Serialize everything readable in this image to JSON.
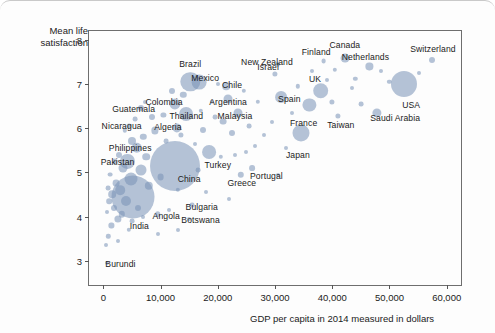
{
  "chart_data": {
    "type": "scatter",
    "title": "",
    "xlabel": "GDP per capita in 2014 measured in dollars",
    "ylabel": "Mean life\nsatisfaction",
    "xlim": [
      -2500,
      62500
    ],
    "ylim": [
      2.45,
      8.2
    ],
    "xticks": [
      0,
      10000,
      20000,
      30000,
      40000,
      50000,
      60000
    ],
    "xticklabels": [
      "0",
      "10,000",
      "20,000",
      "30,000",
      "40,000",
      "50,000",
      "60,000"
    ],
    "yticks": [
      3,
      4,
      5,
      6,
      7,
      8
    ],
    "yticklabels": [
      "3",
      "4",
      "5",
      "6",
      "7",
      "8"
    ],
    "grid": false,
    "legend": false,
    "bubble_color": "#7892b7",
    "frame_color": "#6e6e6e",
    "size_encoding": "population",
    "points": [
      {
        "name": "Switzerland",
        "x": 57500,
        "y": 7.55,
        "r": 3.0,
        "label_x": 57600,
        "label_y": 7.8
      },
      {
        "name": "USA",
        "x": 52500,
        "y": 7.0,
        "r": 13.0,
        "label_x": 53800,
        "label_y": 6.53
      },
      {
        "name": "Netherlands",
        "x": 46500,
        "y": 7.4,
        "r": 3.6,
        "label_x": 45800,
        "label_y": 7.62
      },
      {
        "name": "Canada",
        "x": 42300,
        "y": 7.58,
        "r": 4.4,
        "label_x": 42200,
        "label_y": 7.88
      },
      {
        "name": "Finland",
        "x": 38500,
        "y": 7.52,
        "r": 2.4,
        "label_x": 37200,
        "label_y": 7.72
      },
      {
        "name": "Saudi Arabia",
        "x": 47800,
        "y": 6.35,
        "r": 4.6,
        "label_x": 51000,
        "label_y": 6.22
      },
      {
        "name": "UK",
        "x": 38000,
        "y": 6.85,
        "r": 7.8,
        "label_x": 37000,
        "label_y": 7.12
      },
      {
        "name": "Taiwan",
        "x": 41000,
        "y": 6.27,
        "r": 2.6,
        "label_x": 41500,
        "label_y": 6.07
      },
      {
        "name": "France",
        "x": 36000,
        "y": 6.52,
        "r": 6.6,
        "label_x": 35000,
        "label_y": 6.12
      },
      {
        "name": "Spain",
        "x": 31000,
        "y": 6.7,
        "r": 5.9,
        "label_x": 32500,
        "label_y": 6.65
      },
      {
        "name": "Japan",
        "x": 34500,
        "y": 5.9,
        "r": 8.5,
        "label_x": 34000,
        "label_y": 5.4
      },
      {
        "name": "Israel",
        "x": 30000,
        "y": 7.22,
        "r": 2.6,
        "label_x": 28800,
        "label_y": 7.38
      },
      {
        "name": "New Zealand",
        "x": 30500,
        "y": 7.45,
        "r": 2.2,
        "label_x": 28600,
        "label_y": 7.5
      },
      {
        "name": "Portugal",
        "x": 26000,
        "y": 5.1,
        "r": 2.9,
        "label_x": 28500,
        "label_y": 4.92
      },
      {
        "name": "Greece",
        "x": 24000,
        "y": 4.95,
        "r": 3.2,
        "label_x": 24200,
        "label_y": 4.75
      },
      {
        "name": "Turkey",
        "x": 18500,
        "y": 5.45,
        "r": 6.9,
        "label_x": 20000,
        "label_y": 5.17
      },
      {
        "name": "Malaysia",
        "x": 23500,
        "y": 6.35,
        "r": 4.5,
        "label_x": 23000,
        "label_y": 6.28
      },
      {
        "name": "Argentina",
        "x": 21800,
        "y": 6.65,
        "r": 4.5,
        "label_x": 21800,
        "label_y": 6.6
      },
      {
        "name": "Chile",
        "x": 21500,
        "y": 6.95,
        "r": 3.8,
        "label_x": 22500,
        "label_y": 6.97
      },
      {
        "name": "Mexico",
        "x": 16800,
        "y": 7.05,
        "r": 7.4,
        "label_x": 17800,
        "label_y": 7.14
      },
      {
        "name": "Brazil",
        "x": 15200,
        "y": 7.05,
        "r": 9.7,
        "label_x": 15200,
        "label_y": 7.46
      },
      {
        "name": "Thailand",
        "x": 14500,
        "y": 6.32,
        "r": 6.9,
        "label_x": 14500,
        "label_y": 6.27
      },
      {
        "name": "Colombia",
        "x": 12500,
        "y": 6.55,
        "r": 5.6,
        "label_x": 10600,
        "label_y": 6.6
      },
      {
        "name": "Algeria",
        "x": 12800,
        "y": 6.0,
        "r": 4.6,
        "label_x": 11300,
        "label_y": 6.03
      },
      {
        "name": "China",
        "x": 12500,
        "y": 5.15,
        "r": 25.0,
        "label_x": 15000,
        "label_y": 4.85
      },
      {
        "name": "Bulgaria",
        "x": 15500,
        "y": 4.25,
        "r": 2.4,
        "label_x": 17200,
        "label_y": 4.22
      },
      {
        "name": "Botswana",
        "x": 15000,
        "y": 3.95,
        "r": 2.0,
        "label_x": 17000,
        "label_y": 3.92
      },
      {
        "name": "Angola",
        "x": 9500,
        "y": 4.05,
        "r": 2.8,
        "label_x": 11000,
        "label_y": 4.02
      },
      {
        "name": "Guatemala",
        "x": 6500,
        "y": 6.45,
        "r": 3.0,
        "label_x": 5300,
        "label_y": 6.43
      },
      {
        "name": "Nicaragua",
        "x": 4500,
        "y": 6.05,
        "r": 2.4,
        "label_x": 3200,
        "label_y": 6.05
      },
      {
        "name": "Philippines",
        "x": 5800,
        "y": 5.55,
        "r": 5.2,
        "label_x": 4700,
        "label_y": 5.55
      },
      {
        "name": "Pakistan",
        "x": 4200,
        "y": 5.25,
        "r": 7.1,
        "label_x": 2500,
        "label_y": 5.23
      },
      {
        "name": "India",
        "x": 5200,
        "y": 4.45,
        "r": 21.5,
        "label_x": 6300,
        "label_y": 3.78
      },
      {
        "name": "Burundi",
        "x": 700,
        "y": 2.95,
        "r": 2.0,
        "label_x": 3000,
        "label_y": 2.93
      }
    ],
    "unlabeled_points": [
      {
        "x": 55200,
        "y": 7.25,
        "r": 2.0
      },
      {
        "x": 50000,
        "y": 7.05,
        "r": 2.2
      },
      {
        "x": 48500,
        "y": 7.3,
        "r": 2.0
      },
      {
        "x": 45000,
        "y": 6.55,
        "r": 2.4
      },
      {
        "x": 44000,
        "y": 7.12,
        "r": 2.2
      },
      {
        "x": 43500,
        "y": 6.9,
        "r": 2.0
      },
      {
        "x": 40500,
        "y": 7.32,
        "r": 2.2
      },
      {
        "x": 40000,
        "y": 6.6,
        "r": 2.6
      },
      {
        "x": 39000,
        "y": 7.1,
        "r": 2.0
      },
      {
        "x": 36500,
        "y": 7.3,
        "r": 2.0
      },
      {
        "x": 34000,
        "y": 6.95,
        "r": 2.2
      },
      {
        "x": 33000,
        "y": 6.35,
        "r": 2.0
      },
      {
        "x": 32000,
        "y": 5.55,
        "r": 2.0
      },
      {
        "x": 29500,
        "y": 6.15,
        "r": 2.0
      },
      {
        "x": 28000,
        "y": 5.85,
        "r": 2.0
      },
      {
        "x": 27000,
        "y": 6.6,
        "r": 2.2
      },
      {
        "x": 26500,
        "y": 5.6,
        "r": 2.0
      },
      {
        "x": 25500,
        "y": 6.05,
        "r": 2.4
      },
      {
        "x": 25000,
        "y": 5.45,
        "r": 2.0
      },
      {
        "x": 24500,
        "y": 6.85,
        "r": 2.2
      },
      {
        "x": 23000,
        "y": 5.4,
        "r": 2.0
      },
      {
        "x": 22500,
        "y": 5.9,
        "r": 3.0
      },
      {
        "x": 21000,
        "y": 6.15,
        "r": 3.4
      },
      {
        "x": 20500,
        "y": 5.35,
        "r": 2.2
      },
      {
        "x": 19500,
        "y": 6.25,
        "r": 2.4
      },
      {
        "x": 19000,
        "y": 6.6,
        "r": 2.2
      },
      {
        "x": 18000,
        "y": 4.55,
        "r": 2.0
      },
      {
        "x": 17500,
        "y": 5.95,
        "r": 3.0
      },
      {
        "x": 17000,
        "y": 6.4,
        "r": 2.2
      },
      {
        "x": 16500,
        "y": 5.05,
        "r": 2.4
      },
      {
        "x": 16000,
        "y": 5.65,
        "r": 2.0
      },
      {
        "x": 14000,
        "y": 6.75,
        "r": 3.2
      },
      {
        "x": 13500,
        "y": 5.85,
        "r": 2.6
      },
      {
        "x": 13000,
        "y": 4.6,
        "r": 2.2
      },
      {
        "x": 12000,
        "y": 6.85,
        "r": 3.0
      },
      {
        "x": 11500,
        "y": 4.15,
        "r": 2.0
      },
      {
        "x": 11000,
        "y": 5.7,
        "r": 2.4
      },
      {
        "x": 10500,
        "y": 6.3,
        "r": 2.6
      },
      {
        "x": 10000,
        "y": 4.9,
        "r": 3.4
      },
      {
        "x": 9000,
        "y": 5.95,
        "r": 3.6
      },
      {
        "x": 8500,
        "y": 6.25,
        "r": 3.0
      },
      {
        "x": 8000,
        "y": 4.7,
        "r": 4.2
      },
      {
        "x": 7500,
        "y": 5.35,
        "r": 3.8
      },
      {
        "x": 7000,
        "y": 5.8,
        "r": 3.2
      },
      {
        "x": 6500,
        "y": 5.05,
        "r": 5.5
      },
      {
        "x": 6000,
        "y": 4.2,
        "r": 3.0
      },
      {
        "x": 5500,
        "y": 6.2,
        "r": 2.4
      },
      {
        "x": 5000,
        "y": 5.7,
        "r": 4.0
      },
      {
        "x": 4800,
        "y": 4.85,
        "r": 6.5
      },
      {
        "x": 4000,
        "y": 4.35,
        "r": 5.0
      },
      {
        "x": 3800,
        "y": 5.95,
        "r": 2.2
      },
      {
        "x": 3500,
        "y": 5.1,
        "r": 4.5
      },
      {
        "x": 3200,
        "y": 4.05,
        "r": 3.2
      },
      {
        "x": 3000,
        "y": 4.6,
        "r": 4.8
      },
      {
        "x": 2800,
        "y": 5.4,
        "r": 3.0
      },
      {
        "x": 2500,
        "y": 3.95,
        "r": 3.6
      },
      {
        "x": 2200,
        "y": 4.75,
        "r": 3.4
      },
      {
        "x": 2000,
        "y": 5.25,
        "r": 2.6
      },
      {
        "x": 1800,
        "y": 4.2,
        "r": 3.0
      },
      {
        "x": 1600,
        "y": 4.5,
        "r": 3.8
      },
      {
        "x": 1400,
        "y": 3.8,
        "r": 2.6
      },
      {
        "x": 1200,
        "y": 4.95,
        "r": 2.4
      },
      {
        "x": 1000,
        "y": 4.35,
        "r": 2.8
      },
      {
        "x": 900,
        "y": 3.55,
        "r": 2.2
      },
      {
        "x": 800,
        "y": 4.65,
        "r": 2.4
      },
      {
        "x": 600,
        "y": 4.1,
        "r": 2.0
      },
      {
        "x": 500,
        "y": 3.35,
        "r": 2.0
      },
      {
        "x": 2600,
        "y": 3.45,
        "r": 2.0
      },
      {
        "x": 4500,
        "y": 3.7,
        "r": 2.2
      },
      {
        "x": 5000,
        "y": 3.9,
        "r": 2.4
      },
      {
        "x": 7000,
        "y": 4.0,
        "r": 2.0
      },
      {
        "x": 13000,
        "y": 3.7,
        "r": 2.0
      },
      {
        "x": 9500,
        "y": 3.6,
        "r": 2.0
      },
      {
        "x": 20000,
        "y": 7.0,
        "r": 2.0
      },
      {
        "x": 7200,
        "y": 6.6,
        "r": 2.0
      },
      {
        "x": 30500,
        "y": 4.95,
        "r": 2.0
      },
      {
        "x": 22000,
        "y": 4.4,
        "r": 2.0
      }
    ]
  }
}
